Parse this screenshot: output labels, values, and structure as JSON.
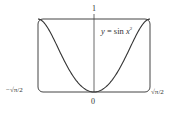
{
  "chart_data": {
    "type": "line",
    "title": "",
    "equation_label": "y = sin x²",
    "series": [
      {
        "name": "y = sin x^2",
        "x": [
          -1.2533,
          -1.1,
          -0.9,
          -0.7,
          -0.5,
          -0.3,
          0,
          0.3,
          0.5,
          0.7,
          0.9,
          1.1,
          1.2533
        ],
        "values": [
          1.0,
          0.9356,
          0.7243,
          0.4706,
          0.2474,
          0.0899,
          0,
          0.0899,
          0.2474,
          0.4706,
          0.7243,
          0.9356,
          1.0
        ]
      }
    ],
    "xlim": [
      -1.2533,
      1.2533
    ],
    "ylim": [
      0,
      1
    ],
    "x_tick_labels": [
      "−√π/2",
      "0",
      "√π/2"
    ],
    "y_tick_labels": [
      "1"
    ],
    "grid": false,
    "legend": "none"
  },
  "labels": {
    "x_left": "−√π/2",
    "x_center": "0",
    "x_right": "√π/2",
    "y_top": "1",
    "eq_y": "y",
    "eq_eq": " = sin ",
    "eq_x": "x",
    "eq_sup": "2"
  }
}
